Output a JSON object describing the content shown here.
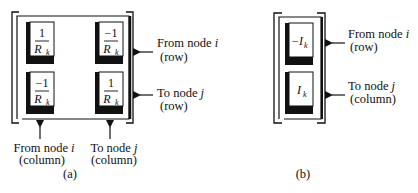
{
  "figure_a": {
    "caption": "(a)",
    "cells": [
      {
        "numerator": "1",
        "denominator": "R",
        "subscript": "k"
      },
      {
        "numerator": "−1",
        "denominator": "R",
        "subscript": "k"
      },
      {
        "numerator": "−1",
        "denominator": "R",
        "subscript": "k"
      },
      {
        "numerator": "1",
        "denominator": "R",
        "subscript": "k"
      }
    ],
    "row_labels": [
      {
        "line1": "From node ",
        "var": "i",
        "line2": "(row)"
      },
      {
        "line1": "To node ",
        "var": "j",
        "line2": "(row)"
      }
    ],
    "column_labels": [
      {
        "line1": "From node ",
        "var": "i",
        "line2": "(column)"
      },
      {
        "line1": "To node ",
        "var": "j",
        "line2": "(column)"
      }
    ]
  },
  "figure_b": {
    "caption": "(b)",
    "cells": [
      {
        "value": "−I",
        "subscript": "k"
      },
      {
        "value": "I",
        "subscript": "k"
      }
    ],
    "row_labels": [
      {
        "line1": "From node ",
        "var": "i",
        "line2": "(row)"
      },
      {
        "line1": "To node ",
        "var": "j",
        "line2": "(column)"
      }
    ]
  }
}
